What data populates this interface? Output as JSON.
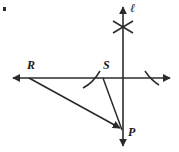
{
  "figure": {
    "kind": "geometry-construction-diagram",
    "background_color": "#ffffff",
    "stroke_color": "#2b2b2b",
    "width": 179,
    "height": 152,
    "labels": {
      "point_r": "R",
      "point_s": "S",
      "point_p": "P",
      "line_l": "ℓ"
    },
    "points": [
      {
        "name": "R",
        "label": "R",
        "x": 29,
        "y": 78
      },
      {
        "name": "S",
        "label": "S",
        "x": 103,
        "y": 78
      },
      {
        "name": "P",
        "label": "P",
        "x": 122,
        "y": 130
      }
    ],
    "lines": [
      {
        "name": "line-l-vertical",
        "label": "ℓ",
        "x1": 123,
        "y1": 5,
        "x2": 123,
        "y2": 148,
        "arrow_start": true,
        "arrow_end": true
      },
      {
        "name": "line-horizontal",
        "label": "",
        "x1": 10,
        "y1": 78,
        "x2": 173,
        "y2": 78,
        "arrow_start": true,
        "arrow_end": true
      }
    ],
    "segments": [
      {
        "name": "segment-R-to-P",
        "x1": 29,
        "y1": 78,
        "x2": 122,
        "y2": 130,
        "arrow_end": true
      },
      {
        "name": "segment-S-to-P",
        "x1": 103,
        "y1": 78,
        "x2": 122,
        "y2": 130,
        "arrow_end": false
      }
    ],
    "construction_arcs": [
      {
        "name": "arc-cross-upper-left",
        "d": "M 113 21 L 133 33"
      },
      {
        "name": "arc-cross-upper-right",
        "d": "M 133 21 L 113 33"
      },
      {
        "name": "arc-near-S",
        "d": "M 83 88 Q 92 82 99 72"
      },
      {
        "name": "arc-right-of-center",
        "d": "M 144 72 Q 151 80 159 85"
      }
    ],
    "corner_artifact": {
      "name": "corner-speck",
      "x": 3,
      "y": 7,
      "w": 3,
      "h": 4
    }
  }
}
